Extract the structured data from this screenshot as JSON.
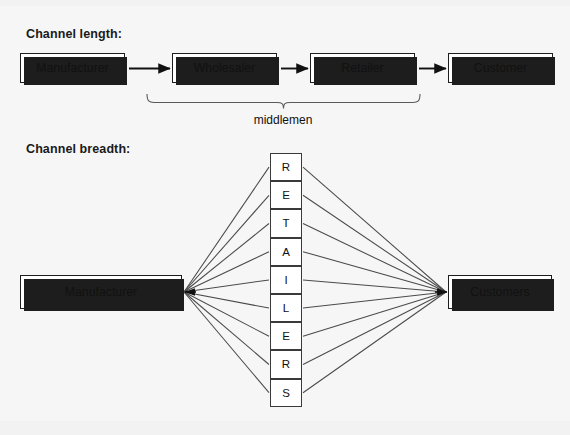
{
  "diagram": {
    "sections": {
      "length": {
        "title": "Channel length:",
        "nodes": [
          {
            "id": "manufacturer",
            "label": "Manufacturer"
          },
          {
            "id": "wholesaler",
            "label": "Wholesaler"
          },
          {
            "id": "retailer",
            "label": "Retailer"
          },
          {
            "id": "customer",
            "label": "Customer"
          }
        ],
        "arrows": [
          {
            "from": "manufacturer",
            "to": "wholesaler"
          },
          {
            "from": "wholesaler",
            "to": "retailer"
          },
          {
            "from": "retailer",
            "to": "customer"
          }
        ],
        "brace": {
          "label": "middlemen",
          "spans": [
            "wholesaler",
            "retailer"
          ]
        }
      },
      "breadth": {
        "title": "Channel breadth:",
        "source": {
          "id": "manufacturer",
          "label": "Manufacturer"
        },
        "target": {
          "id": "customers",
          "label": "Customers"
        },
        "intermediaries_word": "RETAILERS",
        "intermediaries": [
          "R",
          "E",
          "T",
          "A",
          "I",
          "L",
          "E",
          "R",
          "S"
        ],
        "link_count_per_side": 9
      }
    },
    "colors": {
      "page_background": "#f2f2f2",
      "content_background": "#f6f6f6",
      "box_fill": "#ffffff",
      "box_stroke": "#1d1d1d",
      "shadow": "#1d1d1d",
      "line": "#4a4a4a",
      "text": "#111111"
    }
  }
}
